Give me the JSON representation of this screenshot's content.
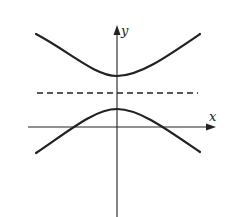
{
  "figure": {
    "axes": {
      "x_label": "x",
      "y_label": "y"
    },
    "curves": [
      {
        "name": "upper-branch",
        "style": "solid"
      },
      {
        "name": "lower-branch",
        "style": "solid"
      }
    ],
    "guide_line": {
      "name": "horizontal-dashed-line",
      "style": "dashed"
    },
    "colors": {
      "background": "#ffffff",
      "ink": "#222222"
    }
  }
}
